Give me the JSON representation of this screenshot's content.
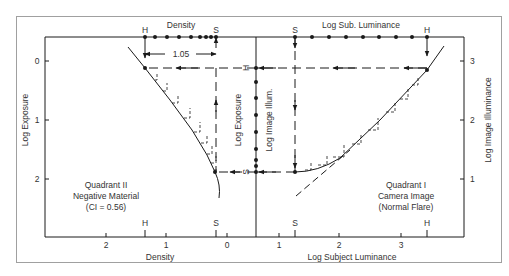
{
  "figure": {
    "frame_color": "#9a9a9a",
    "ink_color": "#1a1a1a",
    "background": "#ffffff"
  },
  "top_axis": {
    "left_label": "Density",
    "right_label": "Log Sub. Luminance",
    "left_markers": {
      "H": "H",
      "S": "S"
    },
    "right_markers": {
      "S": "S",
      "H": "H"
    },
    "density_range_label": "1.05"
  },
  "left_axis": {
    "label": "Log Exposure",
    "ticks": [
      "0",
      "1",
      "2"
    ]
  },
  "right_axis": {
    "label": "Log Image Illuminance",
    "ticks": [
      "3",
      "2",
      "1"
    ]
  },
  "center_axis": {
    "left_label": "Log Exposure",
    "right_label": "Log Image Illum.",
    "markers": {
      "H": "H",
      "S": "S"
    }
  },
  "bottom_axis": {
    "left_label": "Density",
    "left_ticks": [
      "2",
      "1",
      "0"
    ],
    "left_markers": {
      "H": "H",
      "S": "S"
    },
    "right_label": "Log Subject Luminance",
    "right_ticks": [
      "1",
      "2",
      "3"
    ],
    "right_markers": {
      "S": "S",
      "H": "H"
    }
  },
  "quadrant_ii": {
    "line1": "Quadrant II",
    "line2": "Negative Material",
    "line3": "(CI = 0.56)"
  },
  "quadrant_i": {
    "line1": "Quadrant I",
    "line2": "Camera Image",
    "line3": "(Normal Flare)"
  }
}
